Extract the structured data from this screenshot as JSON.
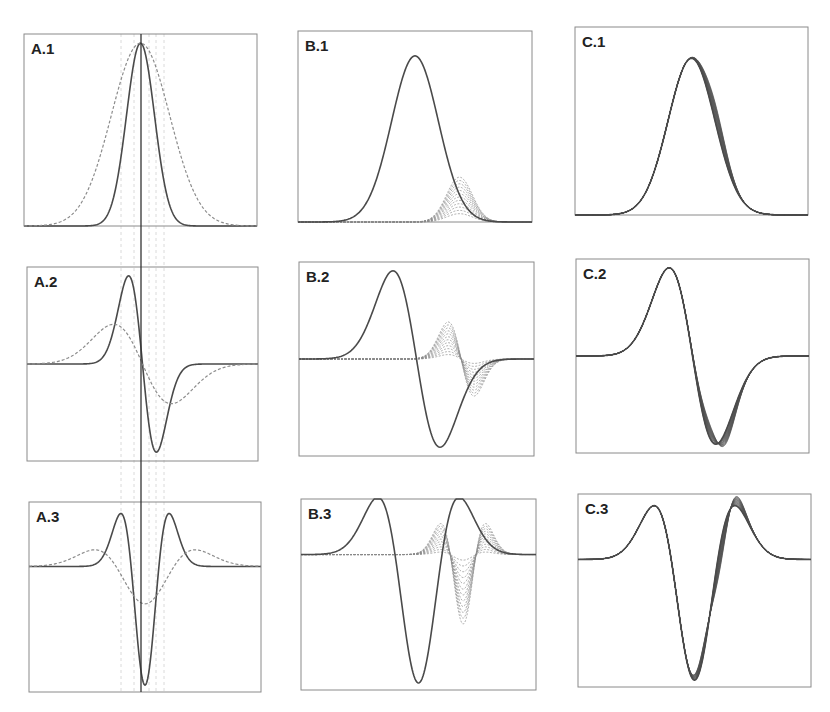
{
  "figure": {
    "width": 830,
    "height": 712,
    "colors": {
      "frame": "#8a8a8a",
      "solid_curve": "#4a4a4a",
      "dashed_curve": "#8c8c8c",
      "family_curves": "#6a6a6a",
      "center_line": "#333333",
      "guide_lines": "#d0d0d0",
      "label": "#222222"
    }
  },
  "panels": [
    {
      "id": "A1",
      "label": "A.1",
      "box": [
        24,
        34,
        233,
        192
      ],
      "baseline": 0.0,
      "ymin": 0,
      "ymax": 1.05,
      "x_range": [
        -5,
        5
      ],
      "curves": [
        {
          "style": "solid",
          "kind": "gauss",
          "deriv": 0,
          "center": 0,
          "sigma": 0.6,
          "amp": 1
        },
        {
          "style": "dashed",
          "kind": "gauss",
          "deriv": 0,
          "center": 0,
          "sigma": 1.25,
          "amp": 1
        }
      ]
    },
    {
      "id": "A2",
      "label": "A.2",
      "box": [
        27,
        267,
        231,
        194
      ],
      "baseline": 0.0,
      "ymin": -1.1,
      "ymax": 1.1,
      "x_range": [
        -5,
        5
      ],
      "curves": [
        {
          "style": "solid",
          "kind": "gauss",
          "deriv": 1,
          "center": 0,
          "sigma": 0.6,
          "amp": 1
        },
        {
          "style": "dashed",
          "kind": "gauss",
          "deriv": 1,
          "center": 0,
          "sigma": 1.25,
          "amp": 0.45
        }
      ]
    },
    {
      "id": "A3",
      "label": "A.3",
      "box": [
        29,
        502,
        232,
        190
      ],
      "baseline": 0.0,
      "ymin": -1.85,
      "ymax": 0.95,
      "x_range": [
        -5,
        5
      ],
      "curves": [
        {
          "style": "solid",
          "kind": "gauss",
          "deriv": 2,
          "center": 0,
          "sigma": 0.6,
          "amp": 1.75
        },
        {
          "style": "dashed",
          "kind": "gauss",
          "deriv": 2,
          "center": 0,
          "sigma": 1.25,
          "amp": 0.55
        }
      ]
    },
    {
      "id": "B1",
      "label": "B.1",
      "box": [
        298,
        31,
        234,
        191
      ],
      "baseline": 0.0,
      "ymin": 0,
      "ymax": 1.15,
      "x_range": [
        -5,
        5
      ],
      "curves": [
        {
          "style": "solid",
          "kind": "gauss",
          "deriv": 0,
          "center": 0,
          "sigma": 1.0,
          "amp": 1
        }
      ],
      "family": {
        "style": "dashed",
        "kind": "gauss",
        "deriv": 0,
        "center": 1.9,
        "sigma": 0.55,
        "amp_from": 0.05,
        "amp_to": 0.27,
        "count": 12
      }
    },
    {
      "id": "B2",
      "label": "B.2",
      "box": [
        299,
        262,
        235,
        194
      ],
      "baseline": 0.0,
      "ymin": -1.1,
      "ymax": 1.1,
      "x_range": [
        -5,
        5
      ],
      "curves": [
        {
          "style": "solid",
          "kind": "gauss",
          "deriv": 1,
          "center": 0,
          "sigma": 1.0,
          "amp": 1
        }
      ],
      "family": {
        "style": "dashed",
        "kind": "gauss",
        "deriv": 1,
        "center": 1.9,
        "sigma": 0.55,
        "amp_from": 0.05,
        "amp_to": 0.42,
        "count": 12
      }
    },
    {
      "id": "B3",
      "label": "B.3",
      "box": [
        301,
        499,
        235,
        191
      ],
      "baseline": 0.0,
      "ymin": -1.95,
      "ymax": 0.8,
      "x_range": [
        -5,
        5
      ],
      "curves": [
        {
          "style": "solid",
          "kind": "gauss",
          "deriv": 2,
          "center": 0,
          "sigma": 1.0,
          "amp": 1.85
        }
      ],
      "family": {
        "style": "dashed",
        "kind": "gauss",
        "deriv": 2,
        "center": 1.9,
        "sigma": 0.55,
        "amp_from": 0.08,
        "amp_to": 1.0,
        "count": 12
      }
    },
    {
      "id": "C1",
      "label": "C.1",
      "box": [
        575,
        27,
        233,
        188
      ],
      "baseline": 0.0,
      "ymin": 0,
      "ymax": 1.2,
      "x_range": [
        -5,
        5
      ],
      "curves": [
        {
          "style": "solid",
          "kind": "gauss",
          "deriv": 0,
          "center": 0,
          "sigma": 1.0,
          "amp": 1
        }
      ],
      "family": {
        "style": "solid",
        "kind": "gauss_plus",
        "deriv": 0,
        "center": 0,
        "sigma": 1.0,
        "amp": 1,
        "bump_center": 1.1,
        "bump_sigma": 0.45,
        "bump_from": 0.0,
        "bump_to": 0.12,
        "count": 14
      }
    },
    {
      "id": "C2",
      "label": "C.2",
      "box": [
        576,
        259,
        233,
        194
      ],
      "baseline": 0.0,
      "ymin": -1.1,
      "ymax": 1.1,
      "x_range": [
        -5,
        5
      ],
      "curves": [
        {
          "style": "solid",
          "kind": "gauss",
          "deriv": 1,
          "center": 0,
          "sigma": 1.0,
          "amp": 1
        }
      ],
      "family": {
        "style": "solid",
        "kind": "gauss_plus",
        "deriv": 1,
        "center": 0,
        "sigma": 1.0,
        "amp": 1,
        "bump_center": 1.1,
        "bump_sigma": 0.45,
        "bump_from": 0.0,
        "bump_to": 0.12,
        "count": 14
      }
    },
    {
      "id": "C3",
      "label": "C.3",
      "box": [
        578,
        494,
        233,
        193
      ],
      "baseline": 0.0,
      "ymin": -1.85,
      "ymax": 0.95,
      "x_range": [
        -5,
        5
      ],
      "curves": [
        {
          "style": "solid",
          "kind": "gauss",
          "deriv": 2,
          "center": 0,
          "sigma": 1.0,
          "amp": 1.75
        }
      ],
      "family": {
        "style": "solid",
        "kind": "gauss_plus",
        "deriv": 2,
        "center": 0,
        "sigma": 1.0,
        "amp": 1.75,
        "bump_center": 1.1,
        "bump_sigma": 0.45,
        "bump_from": 0.0,
        "bump_to": 0.12,
        "count": 14
      }
    }
  ],
  "center_line": {
    "x": 141,
    "y_top": 34,
    "y_bottom": 692
  },
  "guide_lines_x": [
    121,
    134,
    149,
    156,
    164
  ],
  "chart_data": {
    "type": "line",
    "title": "",
    "layout": "3x3 grid of panels; columns A, B, C; rows 1 (function), 2 (first derivative), 3 (second derivative)",
    "grid": false,
    "legend": "none",
    "panels": [
      {
        "label": "A.1",
        "description": "Two Gaussians centered at same point: narrow (solid, sigma~0.6) and wide (dashed, sigma~1.25), both peak-normalized to 1",
        "series": [
          {
            "name": "narrow",
            "style": "solid",
            "x": [
              -3,
              -2,
              -1,
              -0.5,
              0,
              0.5,
              1,
              2,
              3
            ],
            "y": [
              0,
              0,
              0.25,
              0.71,
              1,
              0.71,
              0.25,
              0,
              0
            ]
          },
          {
            "name": "wide",
            "style": "dashed",
            "x": [
              -3,
              -2,
              -1,
              -0.5,
              0,
              0.5,
              1,
              2,
              3
            ],
            "y": [
              0.06,
              0.28,
              0.73,
              0.92,
              1,
              0.92,
              0.73,
              0.28,
              0.06
            ]
          }
        ]
      },
      {
        "label": "A.2",
        "description": "First derivatives: solid narrow (large swing), dashed wide (smaller swing)",
        "series": [
          {
            "name": "narrow",
            "style": "solid",
            "x": [
              -2,
              -1,
              -0.6,
              0,
              0.6,
              1,
              2
            ],
            "y": [
              0,
              0.42,
              1,
              0,
              -1,
              -0.42,
              0
            ]
          },
          {
            "name": "wide",
            "style": "dashed",
            "x": [
              -3,
              -2,
              -1.25,
              0,
              1.25,
              2,
              3
            ],
            "y": [
              0.05,
              0.3,
              0.45,
              0,
              -0.45,
              -0.3,
              -0.05
            ]
          }
        ]
      },
      {
        "label": "A.3",
        "description": "Second derivatives: solid narrow has deep central trough with two side peaks, dashed wide is shallow",
        "series": [
          {
            "name": "narrow",
            "style": "solid",
            "x": [
              -2,
              -1.04,
              -0.6,
              0,
              0.6,
              1.04,
              2
            ],
            "y": [
              0,
              0.78,
              0,
              -1.75,
              0,
              0.78,
              0
            ]
          },
          {
            "name": "wide",
            "style": "dashed",
            "x": [
              -3,
              -2.2,
              -1.25,
              0,
              1.25,
              2.2,
              3
            ],
            "y": [
              0.05,
              0.25,
              0,
              -0.55,
              0,
              0.25,
              0.05
            ]
          }
        ]
      },
      {
        "label": "B.1",
        "description": "Gaussian (solid) plus family of small dashed Gaussians to the right with increasing amplitude (~0.05 to 0.27)",
        "series": [
          {
            "name": "main",
            "style": "solid",
            "x": [
              -3,
              -2,
              -1,
              0,
              1,
              2,
              3
            ],
            "y": [
              0.01,
              0.14,
              0.61,
              1,
              0.61,
              0.14,
              0.01
            ]
          },
          {
            "name": "family",
            "style": "dashed",
            "peak_x": 1.9,
            "amplitudes": [
              0.05,
              0.27
            ]
          }
        ]
      },
      {
        "label": "B.2",
        "description": "First derivative of B.1 with dashed family of derivative bumps",
        "series": [
          {
            "name": "main",
            "style": "solid",
            "x": [
              -3,
              -1,
              0,
              1,
              3
            ],
            "y": [
              0,
              1,
              0,
              -1,
              0
            ]
          },
          {
            "name": "family",
            "style": "dashed",
            "range": [
              0.05,
              0.42
            ]
          }
        ]
      },
      {
        "label": "B.3",
        "description": "Second derivative of B.1 with dashed family",
        "series": [
          {
            "name": "main",
            "style": "solid",
            "x": [
              -3,
              -1.73,
              0,
              1.73,
              3
            ],
            "y": [
              0,
              0.8,
              -1.85,
              0.8,
              0
            ]
          },
          {
            "name": "family",
            "style": "dashed",
            "range": [
              -1.0,
              0.45
            ]
          }
        ]
      },
      {
        "label": "C.1",
        "description": "Sum of Gaussian with small perturbation: family of solid curves fanning on the right flank",
        "series": [
          {
            "name": "family",
            "style": "solid",
            "count": 14
          }
        ]
      },
      {
        "label": "C.2",
        "description": "First derivative of C.1 family; spread visible near the minimum",
        "series": [
          {
            "name": "family",
            "style": "solid",
            "count": 14
          }
        ]
      },
      {
        "label": "C.3",
        "description": "Second derivative of C.1 family; spread visible on right-side peaks",
        "series": [
          {
            "name": "family",
            "style": "solid",
            "count": 14
          }
        ]
      }
    ],
    "xlabel": "",
    "ylabel": ""
  }
}
